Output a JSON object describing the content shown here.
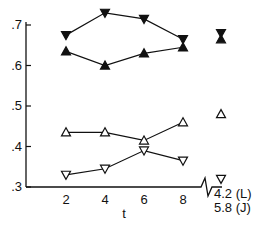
{
  "chart_data": {
    "type": "line",
    "title": "",
    "xlabel": "t",
    "ylabel": "",
    "x": [
      2,
      4,
      6,
      8
    ],
    "xticks": [
      "2",
      "4",
      "6",
      "8"
    ],
    "yticks": [
      ".7",
      ".6",
      ".5",
      ".4",
      ".3"
    ],
    "ylim": [
      0.3,
      0.73
    ],
    "grid": false,
    "legend": null,
    "series": [
      {
        "name": "filled-down-triangle",
        "marker": "filled-down-triangle",
        "values": [
          0.675,
          0.73,
          0.715,
          0.665
        ],
        "extra_value": 0.68
      },
      {
        "name": "filled-up-triangle",
        "marker": "filled-up-triangle",
        "values": [
          0.635,
          0.6,
          0.63,
          0.645
        ],
        "extra_value": 0.665
      },
      {
        "name": "open-up-triangle",
        "marker": "open-up-triangle",
        "values": [
          0.435,
          0.435,
          0.415,
          0.46
        ],
        "extra_value": 0.48
      },
      {
        "name": "open-down-triangle",
        "marker": "open-down-triangle",
        "values": [
          0.33,
          0.345,
          0.39,
          0.365
        ],
        "extra_value": 0.32
      }
    ],
    "annotations": [
      "4.2 (L)",
      "5.8 (J)"
    ]
  }
}
